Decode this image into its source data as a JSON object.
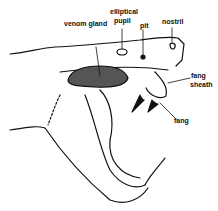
{
  "diagram": {
    "labels": {
      "venom_gland": "venom gland",
      "elliptical_pupil_1": "elliptical",
      "elliptical_pupil_2": "pupil",
      "pit": "pit",
      "nostril": "nostril",
      "fang_sheath_1": "fang",
      "fang_sheath_2": "sheath",
      "fang": "fang"
    }
  }
}
